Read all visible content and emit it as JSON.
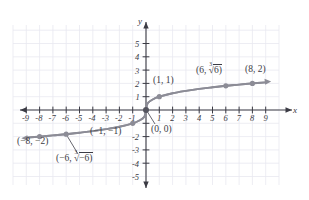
{
  "figure": {
    "kind": "cartesian-graph",
    "curve_color": "#8c8c96",
    "axis_color": "#3b3b44",
    "grid_color": "#e8e8ef",
    "point_color": "#8c8c96"
  },
  "axes": {
    "x_name": "x",
    "y_name": "y",
    "x_ticks": [
      "-9",
      "-8",
      "-7",
      "-6",
      "-5",
      "-4",
      "-3",
      "-2",
      "-1",
      "1",
      "2",
      "3",
      "4",
      "5",
      "6",
      "7",
      "8",
      "9"
    ],
    "y_ticks": [
      "5",
      "4",
      "3",
      "2",
      "1",
      "-2",
      "-3",
      "-4",
      "-5"
    ]
  },
  "point_labels": {
    "p_1_1": "(1, 1)",
    "p_6_cbrt6_prefix": "(6, ",
    "p_6_cbrt6_index": "3",
    "p_6_cbrt6_radicand": "6)",
    "p_8_2": "(8, 2)",
    "p_0_0": "(0, 0)",
    "p_n1_n1": "(−1, −1)",
    "p_n8_n2": "(−8, −2)",
    "p_n6_cbrtn6_prefix": "(−6, ",
    "p_n6_cbrtn6_index": "3",
    "p_n6_cbrtn6_radicand": "−6)"
  },
  "chart_data": {
    "type": "line",
    "title": "",
    "xlabel": "x",
    "ylabel": "y",
    "xlim": [
      -9.8,
      9.8
    ],
    "ylim": [
      -5.8,
      5.8
    ],
    "grid": true,
    "legend": "none",
    "function": "y = cube root of x",
    "series": [
      {
        "name": "y = ∛ x",
        "x": [
          -9,
          -8,
          -7,
          -6,
          -5,
          -4,
          -3,
          -2,
          -1,
          -0.5,
          -0.125,
          0,
          0.125,
          0.5,
          1,
          2,
          3,
          4,
          5,
          6,
          7,
          8,
          9
        ],
        "y": [
          -2.08,
          -2.0,
          -1.91,
          -1.82,
          -1.71,
          -1.59,
          -1.44,
          -1.26,
          -1.0,
          -0.79,
          -0.5,
          0,
          0.5,
          0.79,
          1.0,
          1.26,
          1.44,
          1.59,
          1.71,
          1.82,
          1.91,
          2.0,
          2.08
        ]
      }
    ],
    "marked_points": [
      {
        "x": -8,
        "y": -2,
        "label": "(−8, −2)"
      },
      {
        "x": -6,
        "y": -1.817,
        "label": "(−6, ∛−6)"
      },
      {
        "x": -1,
        "y": -1,
        "label": "(−1, −1)"
      },
      {
        "x": 0,
        "y": 0,
        "label": "(0, 0)"
      },
      {
        "x": 1,
        "y": 1,
        "label": "(1, 1)"
      },
      {
        "x": 6,
        "y": 1.817,
        "label": "(6, ∛6)"
      },
      {
        "x": 8,
        "y": 2,
        "label": "(8, 2)"
      }
    ]
  }
}
